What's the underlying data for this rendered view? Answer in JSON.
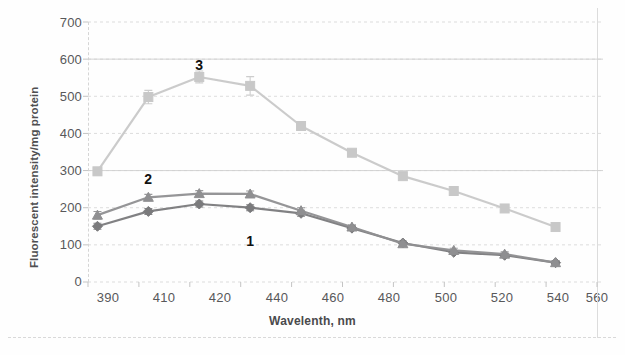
{
  "chart_data": {
    "type": "line",
    "title": "",
    "xlabel": "Wavelenth, nm",
    "ylabel": "Fluorescent intensity/mg protein",
    "categories": [
      "390",
      "410",
      "420",
      "440",
      "460",
      "480",
      "500",
      "520",
      "540",
      "560"
    ],
    "ylim": [
      0,
      700
    ],
    "yticks": [
      "0",
      "100",
      "200",
      "300",
      "400",
      "500",
      "600",
      "700"
    ],
    "grid": true,
    "legend_position": "inline-annotations",
    "series": [
      {
        "name": "1",
        "marker": "diamond",
        "color": "#7a7a7c",
        "values": [
          150,
          190,
          210,
          200,
          185,
          145,
          105,
          80,
          72,
          52
        ],
        "errors": [
          8,
          8,
          8,
          8,
          8,
          6,
          5,
          5,
          5,
          5
        ]
      },
      {
        "name": "2",
        "marker": "triangle",
        "color": "#8f8f91",
        "values": [
          180,
          228,
          238,
          237,
          192,
          148,
          103,
          85,
          75,
          52
        ],
        "errors": [
          10,
          8,
          8,
          8,
          8,
          6,
          5,
          6,
          6,
          5
        ]
      },
      {
        "name": "3",
        "marker": "square",
        "color": "#c8c8c8",
        "values": [
          298,
          498,
          552,
          528,
          420,
          348,
          285,
          245,
          198,
          148
        ],
        "errors": [
          10,
          18,
          16,
          25,
          10,
          8,
          8,
          8,
          8,
          8
        ]
      }
    ],
    "annotations": [
      {
        "label": "1",
        "x_category": "440",
        "value": 105
      },
      {
        "label": "2",
        "x_category": "410",
        "value": 272
      },
      {
        "label": "3",
        "x_category": "420",
        "value": 580
      }
    ]
  },
  "axis": {
    "y_tick_0": "0",
    "y_tick_100": "100",
    "y_tick_200": "200",
    "y_tick_300": "300",
    "y_tick_400": "400",
    "y_tick_500": "500",
    "y_tick_600": "600",
    "y_tick_700": "700",
    "x_tick_0": "390",
    "x_tick_1": "410",
    "x_tick_2": "420",
    "x_tick_3": "440",
    "x_tick_4": "460",
    "x_tick_5": "480",
    "x_tick_6": "500",
    "x_tick_7": "520",
    "x_tick_8": "540",
    "x_tick_9": "560"
  },
  "colors": {
    "series1": "#7a7a7c",
    "series2": "#8f8f91",
    "series3": "#c8c8c8",
    "grid": "#d8d8d8",
    "text": "#58585a",
    "background": "#ffffff"
  }
}
